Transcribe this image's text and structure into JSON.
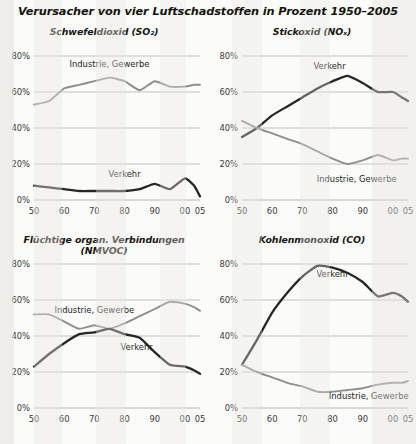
{
  "title": "Verursacher von vier Luftschadstoffen in Prozent 1950–2005",
  "colors": {
    "verkehr": "#262626",
    "industrie": "#8e8e8c",
    "grid": "#b4b4b2",
    "axis_text": "#3a3a38",
    "background": "#fbfbfa"
  },
  "axes": {
    "ytick_labels": [
      "0%",
      "20%",
      "40%",
      "60%",
      "80%"
    ],
    "ytick_values": [
      0,
      20,
      40,
      60,
      80
    ],
    "xtick_labels": [
      "50",
      "60",
      "70",
      "80",
      "90",
      "00",
      "05"
    ],
    "xtick_values": [
      1950,
      1960,
      1970,
      1980,
      1990,
      2000,
      2005
    ],
    "ylim": [
      0,
      80
    ],
    "xlim": [
      1950,
      2005
    ],
    "grid": "horizontal"
  },
  "series_names": {
    "verkehr": "Verkehr",
    "industrie": "Industrie, Gewerbe"
  },
  "chart_data": [
    {
      "id": "so2",
      "type": "line",
      "title": "Schwefeldioxid (SO₂)",
      "position": "top-left",
      "xlabel": "",
      "ylabel": "",
      "xlim": [
        1950,
        2005
      ],
      "ylim": [
        0,
        80
      ],
      "x": [
        1950,
        1955,
        1960,
        1965,
        1970,
        1975,
        1980,
        1985,
        1990,
        1995,
        2000,
        2003,
        2005
      ],
      "series": [
        {
          "name": "Industrie, Gewerbe",
          "color": "#8e8e8c",
          "values": [
            53,
            55,
            62,
            64,
            66,
            68,
            66,
            61,
            66,
            63,
            63,
            64,
            64
          ],
          "label_x": 1975,
          "label_y": 74
        },
        {
          "name": "Verkehr",
          "color": "#262626",
          "values": [
            8,
            7,
            6,
            5,
            5,
            5,
            5,
            6,
            9,
            6,
            12,
            8,
            2
          ],
          "label_x": 1980,
          "label_y": 13
        }
      ]
    },
    {
      "id": "nox",
      "type": "line",
      "title": "Stickoxid (NOₓ)",
      "position": "top-right",
      "xlabel": "",
      "ylabel": "",
      "xlim": [
        1950,
        2005
      ],
      "ylim": [
        0,
        80
      ],
      "x": [
        1950,
        1955,
        1960,
        1965,
        1970,
        1975,
        1980,
        1985,
        1990,
        1995,
        2000,
        2003,
        2005
      ],
      "series": [
        {
          "name": "Verkehr",
          "color": "#262626",
          "values": [
            35,
            40,
            47,
            52,
            57,
            62,
            66,
            69,
            65,
            60,
            60,
            57,
            55
          ],
          "label_x": 1979,
          "label_y": 73
        },
        {
          "name": "Industrie, Gewerbe",
          "color": "#8e8e8c",
          "values": [
            44,
            40,
            37,
            34,
            31,
            27,
            23,
            20,
            22,
            25,
            22,
            23,
            23
          ],
          "label_x": 1988,
          "label_y": 10
        }
      ]
    },
    {
      "id": "nmvoc",
      "type": "line",
      "title": "Flüchtige organ. Verbindungen (NMVOC)",
      "position": "bottom-left",
      "xlabel": "",
      "ylabel": "",
      "xlim": [
        1950,
        2005
      ],
      "ylim": [
        0,
        80
      ],
      "x": [
        1950,
        1955,
        1960,
        1965,
        1970,
        1975,
        1980,
        1985,
        1990,
        1995,
        2000,
        2003,
        2005
      ],
      "series": [
        {
          "name": "Industrie, Gewerbe",
          "color": "#8e8e8c",
          "values": [
            52,
            52,
            48,
            44,
            46,
            44,
            47,
            51,
            55,
            59,
            58,
            56,
            54
          ],
          "label_x": 1970,
          "label_y": 53
        },
        {
          "name": "Verkehr",
          "color": "#262626",
          "values": [
            23,
            30,
            36,
            41,
            42,
            44,
            41,
            39,
            31,
            24,
            23,
            21,
            19
          ],
          "label_x": 1984,
          "label_y": 32
        }
      ]
    },
    {
      "id": "co",
      "type": "line",
      "title": "Kohlenmonoxid (CO)",
      "position": "bottom-right",
      "xlabel": "",
      "ylabel": "",
      "xlim": [
        1950,
        2005
      ],
      "ylim": [
        0,
        80
      ],
      "x": [
        1950,
        1955,
        1960,
        1965,
        1970,
        1975,
        1980,
        1985,
        1990,
        1995,
        2000,
        2003,
        2005
      ],
      "series": [
        {
          "name": "Verkehr",
          "color": "#262626",
          "values": [
            24,
            38,
            53,
            64,
            73,
            79,
            78,
            75,
            70,
            62,
            64,
            62,
            59
          ],
          "label_x": 1980,
          "label_y": 73
        },
        {
          "name": "Industrie, Gewerbe",
          "color": "#8e8e8c",
          "values": [
            24,
            20,
            17,
            14,
            12,
            9,
            9,
            10,
            11,
            13,
            14,
            14,
            15
          ],
          "label_x": 1992,
          "label_y": 5
        }
      ]
    }
  ]
}
